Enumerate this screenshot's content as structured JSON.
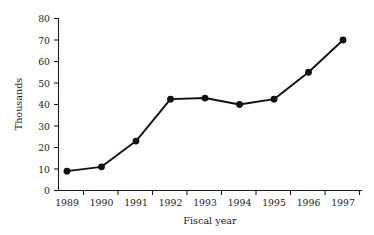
{
  "chart_data": {
    "type": "line",
    "title": "",
    "subtitle": "",
    "xlabel": "Fiscal year",
    "ylabel": "Thousands",
    "categories": [
      "1989",
      "1990",
      "1991",
      "1992",
      "1993",
      "1994",
      "1995",
      "1996",
      "1997"
    ],
    "values": [
      9,
      11,
      23,
      42.5,
      43,
      40,
      42.5,
      55,
      70
    ],
    "series": [
      {
        "name": "",
        "values": [
          9,
          11,
          23,
          42.5,
          43,
          40,
          42.5,
          55,
          70
        ]
      }
    ],
    "ylim": [
      0,
      80
    ],
    "yticks": [
      0,
      10,
      20,
      30,
      40,
      50,
      60,
      70,
      80
    ],
    "ytick_labels": [
      "0",
      "10",
      "20",
      "30",
      "40",
      "50",
      "60",
      "70",
      "80"
    ],
    "xtick_labels": [
      "1989",
      "1990",
      "1991",
      "1992",
      "1993",
      "1994",
      "1995",
      "1996",
      "1997"
    ],
    "grid": false,
    "legend": false,
    "legend_position": "none",
    "marker": "circle",
    "line_color": "#111111",
    "marker_color": "#111111",
    "axis_color": "#1a1a1a",
    "background_color": "#ffffff"
  }
}
